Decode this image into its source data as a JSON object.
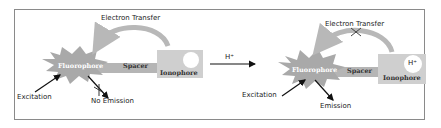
{
  "diagram": {
    "left_state": {
      "fluorophore_label": "Fluorophore",
      "spacer_label": "Spacer",
      "ionophore_label": "Ionophore",
      "electron_transfer_label": "Electron Transfer",
      "excitation_label": "Excitation",
      "emission_label": "No Emission",
      "ion_bound": ""
    },
    "transition": {
      "label": "H⁺"
    },
    "right_state": {
      "fluorophore_label": "Fluorophore",
      "spacer_label": "Spacer",
      "ionophore_label": "Ionophore",
      "electron_transfer_label": "Electron Transfer",
      "excitation_label": "Excitation",
      "emission_label": "Emission",
      "ion_bound": "H⁺"
    },
    "colors": {
      "fluorophore_fill": "#a9a9a9",
      "spacer_fill": "#b5b5b5",
      "ionophore_fill": "#cfcfcf",
      "arc": "#b8b8b8",
      "arrow": "#111111",
      "frame": "#8a8a8a"
    }
  }
}
